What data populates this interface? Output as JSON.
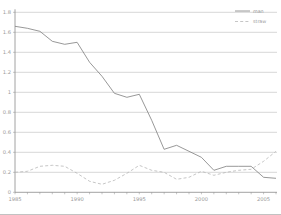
{
  "chart_data": {
    "type": "line",
    "title": "",
    "xlabel": "",
    "ylabel": "",
    "x": [
      1985,
      1986,
      1987,
      1988,
      1989,
      1990,
      1991,
      1992,
      1993,
      1994,
      1995,
      1996,
      1997,
      1998,
      1999,
      2000,
      2001,
      2002,
      2003,
      2004,
      2005,
      2006
    ],
    "xlim": [
      1985,
      2006
    ],
    "ylim": [
      0,
      1.8
    ],
    "x_tick_years": [
      1985,
      1990,
      1995,
      2000,
      2005
    ],
    "x_tick_labels": [
      "1985",
      "1990",
      "1995",
      "2000",
      "2005"
    ],
    "y_ticks": [
      0,
      0.2,
      0.4,
      0.6,
      0.8,
      1,
      1.2,
      1.4,
      1.6,
      1.8
    ],
    "y_tick_labels": [
      "0",
      "0.2",
      "0.4",
      "0.6",
      "0.8",
      "1",
      "1.2",
      "1.4",
      "1.6",
      "1.8"
    ],
    "grid": "horizontal",
    "legend_position": "top-right",
    "series": [
      {
        "name": "man",
        "line_style": "solid",
        "color": "#7d7d7d",
        "values": [
          1.66,
          1.64,
          1.61,
          1.51,
          1.48,
          1.5,
          1.3,
          1.16,
          0.99,
          0.95,
          0.98,
          0.72,
          0.43,
          0.47,
          0.41,
          0.35,
          0.22,
          0.26,
          0.26,
          0.26,
          0.15,
          0.14
        ]
      },
      {
        "name": "straw",
        "line_style": "dashed",
        "color": "#b7b7b7",
        "values": [
          0.2,
          0.21,
          0.26,
          0.27,
          0.26,
          0.19,
          0.11,
          0.08,
          0.12,
          0.19,
          0.27,
          0.22,
          0.2,
          0.13,
          0.15,
          0.21,
          0.17,
          0.2,
          0.22,
          0.23,
          0.31,
          0.41
        ]
      }
    ],
    "colors": {
      "axis": "#8c8c8c",
      "grid": "#c6c6c6",
      "tick_label": "#9a9a9a",
      "legend_text": "#9a9a9a",
      "background": "#ffffff"
    }
  }
}
